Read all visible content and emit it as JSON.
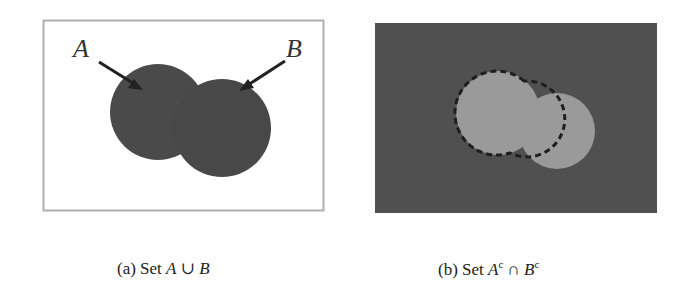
{
  "figure": {
    "panels": [
      {
        "id": "a",
        "labels": {
          "A": "A",
          "B": "B"
        },
        "caption": {
          "prefix": "(a) Set ",
          "expr_left": "A",
          "op": "∪",
          "expr_right": "B"
        },
        "colors": {
          "background": "#ffffff",
          "border": "#b0b0b0",
          "fill": "#4a4a4a"
        }
      },
      {
        "id": "b",
        "caption": {
          "prefix": "(b) Set ",
          "expr_left": "A",
          "sup_left": "c",
          "op": "∩",
          "expr_right": "B",
          "sup_right": "c"
        },
        "colors": {
          "background": "#505050",
          "fill": "#9a9a9a",
          "outline": "#1e1e1e"
        }
      }
    ]
  }
}
